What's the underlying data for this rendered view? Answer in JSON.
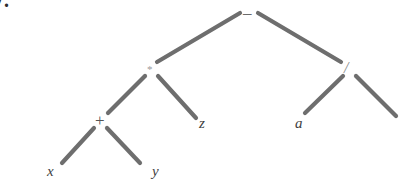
{
  "figure": {
    "caption_number": "7.",
    "background_color": "#ffffff",
    "edge_color": "#6e6e6e",
    "label_color": "#4a4a4a",
    "width": 403,
    "height": 181
  },
  "tree": {
    "nodes": [
      {
        "id": "root",
        "label": "–",
        "kind": "operator",
        "x": 248,
        "y": 12,
        "role": "subtraction"
      },
      {
        "id": "mul",
        "label": "*",
        "kind": "operator",
        "x": 151,
        "y": 70,
        "role": "multiplication"
      },
      {
        "id": "div",
        "label": "/",
        "kind": "operator",
        "x": 348,
        "y": 69,
        "role": "division"
      },
      {
        "id": "plus",
        "label": "+",
        "kind": "operator",
        "x": 100,
        "y": 121,
        "role": "addition"
      },
      {
        "id": "z",
        "label": "z",
        "kind": "variable",
        "x": 203,
        "y": 124,
        "role": "operand"
      },
      {
        "id": "a",
        "label": "a",
        "kind": "variable",
        "x": 299,
        "y": 124,
        "role": "operand"
      },
      {
        "id": "x",
        "label": "x",
        "kind": "variable",
        "x": 51,
        "y": 172,
        "role": "operand"
      },
      {
        "id": "y",
        "label": "y",
        "kind": "variable",
        "x": 156,
        "y": 172,
        "role": "operand"
      }
    ],
    "edges": [
      {
        "from": "root",
        "to": "mul",
        "x1": 240,
        "y1": 13,
        "x2": 157,
        "y2": 62
      },
      {
        "from": "root",
        "to": "div",
        "x1": 258,
        "y1": 13,
        "x2": 341,
        "y2": 62
      },
      {
        "from": "mul",
        "to": "plus",
        "x1": 145,
        "y1": 76,
        "x2": 108,
        "y2": 113
      },
      {
        "from": "mul",
        "to": "z",
        "x1": 158,
        "y1": 76,
        "x2": 196,
        "y2": 118
      },
      {
        "from": "div",
        "to": "a",
        "x1": 343,
        "y1": 76,
        "x2": 305,
        "y2": 113
      },
      {
        "from": "div",
        "to": "right",
        "x1": 356,
        "y1": 76,
        "x2": 396,
        "y2": 116
      },
      {
        "from": "plus",
        "to": "x",
        "x1": 94,
        "y1": 128,
        "x2": 62,
        "y2": 163
      },
      {
        "from": "plus",
        "to": "y",
        "x1": 107,
        "y1": 128,
        "x2": 140,
        "y2": 163
      }
    ]
  }
}
